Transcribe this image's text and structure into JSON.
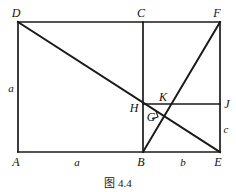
{
  "figure": {
    "caption": "图 4.4",
    "caption_x": 118,
    "caption_y": 174,
    "canvas": {
      "width": 236,
      "height": 192
    },
    "stroke_color": "#1a1a1a",
    "background_color": "#ffffff",
    "points": {
      "A": {
        "x": 18,
        "y": 152
      },
      "B": {
        "x": 143,
        "y": 152
      },
      "E": {
        "x": 220,
        "y": 152
      },
      "D": {
        "x": 18,
        "y": 22
      },
      "C": {
        "x": 143,
        "y": 22
      },
      "F": {
        "x": 220,
        "y": 22
      },
      "H": {
        "x": 143,
        "y": 104
      },
      "J": {
        "x": 220,
        "y": 104
      },
      "K": {
        "x": 158,
        "y": 104
      },
      "G": {
        "x": 152,
        "y": 117
      }
    },
    "segments": [
      {
        "name": "A-D",
        "from": "A",
        "to": "D"
      },
      {
        "name": "D-F",
        "from": "D",
        "to": "F"
      },
      {
        "name": "F-E",
        "from": "F",
        "to": "E"
      },
      {
        "name": "A-E",
        "from": "A",
        "to": "E"
      },
      {
        "name": "C-B",
        "from": "C",
        "to": "B"
      },
      {
        "name": "D-E",
        "from": "D",
        "to": "E"
      },
      {
        "name": "B-F",
        "from": "B",
        "to": "F"
      },
      {
        "name": "H-J",
        "from": "H",
        "to": "J"
      }
    ],
    "right_angle_mark": {
      "x": 155,
      "y": 115,
      "size": 6,
      "at": "G"
    },
    "vertex_labels": [
      {
        "id": "label-D",
        "text": "D",
        "x": 16,
        "y": 13
      },
      {
        "id": "label-C",
        "text": "C",
        "x": 141,
        "y": 13
      },
      {
        "id": "label-F",
        "text": "F",
        "x": 217,
        "y": 13
      },
      {
        "id": "label-A",
        "text": "A",
        "x": 16,
        "y": 162
      },
      {
        "id": "label-B",
        "text": "B",
        "x": 141,
        "y": 162
      },
      {
        "id": "label-E",
        "text": "E",
        "x": 218,
        "y": 162
      },
      {
        "id": "label-H",
        "text": "H",
        "x": 134,
        "y": 108
      },
      {
        "id": "label-J",
        "text": "J",
        "x": 227,
        "y": 104
      },
      {
        "id": "label-K",
        "text": "K",
        "x": 163,
        "y": 97
      },
      {
        "id": "label-G",
        "text": "G",
        "x": 151,
        "y": 117
      }
    ],
    "segment_labels": [
      {
        "id": "seg-label-a-left",
        "text": "a",
        "x": 11,
        "y": 88
      },
      {
        "id": "seg-label-a-bottom",
        "text": "a",
        "x": 77,
        "y": 162
      },
      {
        "id": "seg-label-b-bottom",
        "text": "b",
        "x": 183,
        "y": 162
      },
      {
        "id": "seg-label-c-right",
        "text": "c",
        "x": 226,
        "y": 129
      }
    ]
  }
}
